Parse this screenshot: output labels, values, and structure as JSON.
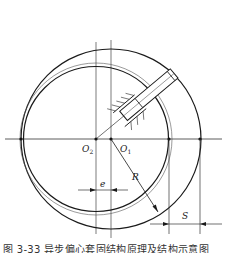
{
  "figure": {
    "type": "mechanism-diagram",
    "labels": {
      "o2": "O",
      "o2_sub": "2",
      "o1": "O",
      "o1_sub": "1",
      "radius": "R",
      "eccentricity": "e",
      "stroke": "S"
    },
    "caption": "图 3-33  异步偏心套固结构原理及结构示意图",
    "colors": {
      "line": "#1a1a1a",
      "thin_line": "#555555",
      "background": "#ffffff"
    }
  }
}
